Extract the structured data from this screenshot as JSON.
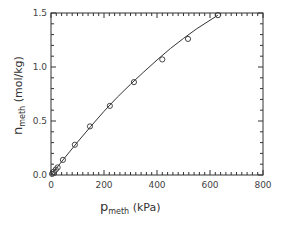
{
  "chart_data": {
    "type": "scatter",
    "title": "",
    "xlabel": "p_meth (kPa)",
    "ylabel": "n_meth (mol/kg)",
    "xlabel_main": "p",
    "xlabel_sub": "meth",
    "xlabel_unit": " (kPa)",
    "ylabel_main": "n",
    "ylabel_sub": "meth",
    "ylabel_unit": " (mol/kg)",
    "xlim": [
      0,
      800
    ],
    "ylim": [
      0,
      1.5
    ],
    "xticks": [
      0,
      200,
      400,
      600,
      800
    ],
    "xtick_labels": [
      "0",
      "200",
      "400",
      "600",
      "800"
    ],
    "yticks": [
      0.0,
      0.5,
      1.0,
      1.5
    ],
    "ytick_labels": [
      "0.0",
      "0.5",
      "1.0",
      "1.5"
    ],
    "x_minor_step": 20,
    "y_minor_step": 0.1,
    "grid": false,
    "legend": null,
    "series": [
      {
        "name": "experimental",
        "marker": "open-circle",
        "points": [
          [
            4,
            0.01
          ],
          [
            10,
            0.03
          ],
          [
            18,
            0.05
          ],
          [
            25,
            0.07
          ],
          [
            45,
            0.14
          ],
          [
            90,
            0.28
          ],
          [
            147,
            0.45
          ],
          [
            222,
            0.64
          ],
          [
            313,
            0.86
          ],
          [
            420,
            1.07
          ],
          [
            517,
            1.26
          ],
          [
            630,
            1.48
          ]
        ]
      },
      {
        "name": "fit",
        "marker": "line",
        "points": [
          [
            0,
            0.0
          ],
          [
            50,
            0.155
          ],
          [
            100,
            0.305
          ],
          [
            150,
            0.45
          ],
          [
            200,
            0.59
          ],
          [
            250,
            0.72
          ],
          [
            300,
            0.84
          ],
          [
            350,
            0.955
          ],
          [
            400,
            1.065
          ],
          [
            450,
            1.17
          ],
          [
            500,
            1.265
          ],
          [
            550,
            1.355
          ],
          [
            630,
            1.48
          ]
        ]
      }
    ]
  },
  "colors": {
    "axis": "#333333",
    "line": "#333333",
    "marker": "#333333",
    "background": "#ffffff"
  }
}
